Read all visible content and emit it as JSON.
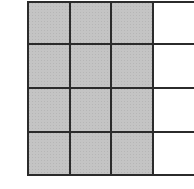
{
  "diagram": {
    "type": "fraction-grid",
    "rows": 4,
    "columns": 4,
    "shaded_columns": 3,
    "shaded_cells": 12,
    "total_cells": 16,
    "fraction_shaded": "3/4",
    "colors": {
      "shaded": "#c4c4c4",
      "empty": "#ffffff",
      "line": "#2b2b2b"
    },
    "cells": [
      [
        true,
        true,
        true,
        false
      ],
      [
        true,
        true,
        true,
        false
      ],
      [
        true,
        true,
        true,
        false
      ],
      [
        true,
        true,
        true,
        false
      ]
    ]
  }
}
